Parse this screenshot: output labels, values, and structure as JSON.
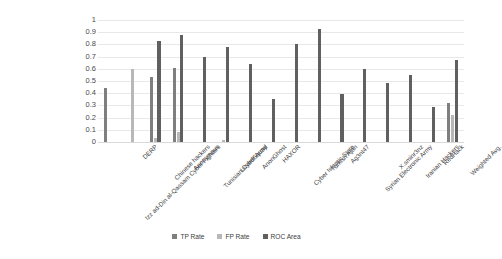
{
  "chart_data": {
    "type": "bar",
    "title": "",
    "xlabel": "",
    "ylabel": "",
    "ylim": [
      0,
      1
    ],
    "ytick_labels": [
      "1",
      "0.9",
      "0.8",
      "0.7",
      "0.6",
      "0.5",
      "0.4",
      "0.3",
      "0.2",
      "0.1",
      "0"
    ],
    "ytick_values": [
      1,
      0.9,
      0.8,
      0.7,
      0.6,
      0.5,
      0.4,
      0.3,
      0.2,
      0.1,
      0
    ],
    "grid": true,
    "legend_position": "bottom",
    "categories": [
      "Izz ad-Din al-Qassam Cyber Fighters",
      "DERP",
      "Chinese hackers",
      "Anonymous",
      "Tunisian Cyber Army",
      "LizardSquad",
      "AnonGhost",
      "HAXOR",
      "Cyber Islamic State",
      "Turkish Ajan",
      "Ag3nt47",
      "Syrian Electronic Army",
      "X.sminr3nz",
      "Iranian Hackers",
      "RedHack",
      "Weighted Avg."
    ],
    "series": [
      {
        "name": "TP Rate",
        "color": "#7f7f7f",
        "values": [
          0.44,
          0,
          0.53,
          0.61,
          0,
          0,
          0,
          0,
          0,
          0,
          0,
          0,
          0,
          0,
          0,
          0.32
        ]
      },
      {
        "name": "FP Rate",
        "color": "#b8b8b8",
        "values": [
          0,
          0.6,
          0.03,
          0.08,
          0,
          0.02,
          0,
          0,
          0,
          0,
          0,
          0,
          0,
          0,
          0,
          0.22
        ]
      },
      {
        "name": "ROC Area",
        "color": "#606060",
        "values": [
          0,
          0,
          0.83,
          0.88,
          0.7,
          0.78,
          0.64,
          0.35,
          0.8,
          0.93,
          0.39,
          0.6,
          0.48,
          0.55,
          0.29,
          0.67
        ]
      }
    ]
  },
  "legend": {
    "items": [
      {
        "label": "TP Rate"
      },
      {
        "label": "FP Rate"
      },
      {
        "label": "ROC Area"
      }
    ]
  }
}
